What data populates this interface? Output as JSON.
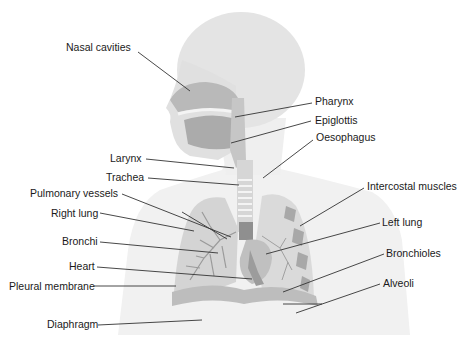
{
  "diagram": {
    "colors": {
      "background": "#ffffff",
      "head_silhouette": "#e4e4e4",
      "body_silhouette": "#f1f1f1",
      "tissue_medium": "#c8c8c8",
      "tissue_dark": "#a9a9a9",
      "vessels": "#8f8f8f",
      "leader_line": "#333333",
      "label_text": "#1a1a1a"
    },
    "labels_left": [
      {
        "id": "nasal-cavities",
        "text": "Nasal cavities"
      },
      {
        "id": "larynx",
        "text": "Larynx"
      },
      {
        "id": "trachea",
        "text": "Trachea"
      },
      {
        "id": "pulmonary-vessels",
        "text": "Pulmonary vessels"
      },
      {
        "id": "right-lung",
        "text": "Right lung"
      },
      {
        "id": "bronchi",
        "text": "Bronchi"
      },
      {
        "id": "heart",
        "text": "Heart"
      },
      {
        "id": "pleural-membrane",
        "text": "Pleural membrane"
      },
      {
        "id": "diaphragm",
        "text": "Diaphragm"
      }
    ],
    "labels_right": [
      {
        "id": "pharynx",
        "text": "Pharynx"
      },
      {
        "id": "epiglottis",
        "text": "Epiglottis"
      },
      {
        "id": "oesophagus",
        "text": "Oesophagus"
      },
      {
        "id": "intercostal-muscles",
        "text": "Intercostal muscles"
      },
      {
        "id": "left-lung",
        "text": "Left lung"
      },
      {
        "id": "bronchioles",
        "text": "Bronchioles"
      },
      {
        "id": "alveoli",
        "text": "Alveoli"
      }
    ]
  }
}
